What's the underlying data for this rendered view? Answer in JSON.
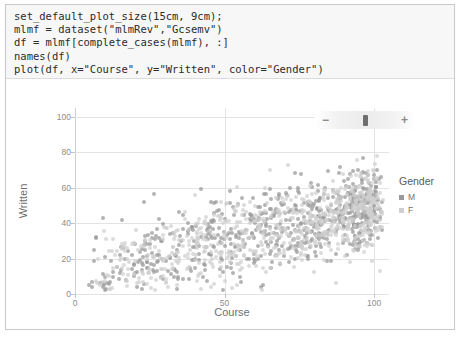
{
  "code_cell": {
    "lines": [
      "set_default_plot_size(15cm, 9cm);",
      "mlmf = dataset(\"mlmRev\",\"Gcsemv\")",
      "df = mlmf[complete_cases(mlmf), :]",
      "names(df)",
      "plot(df, x=\"Course\", y=\"Written\", color=\"Gender\")"
    ]
  },
  "toolbar": {
    "zoom_out_label": "−",
    "zoom_in_label": "+",
    "slider_handle_name": "zoom-slider-handle"
  },
  "legend": {
    "title": "Gender",
    "entries": [
      {
        "label": "M",
        "color": "#9a9a9a"
      },
      {
        "label": "F",
        "color": "#cfcfcf"
      }
    ]
  },
  "chart_data": {
    "type": "scatter",
    "title": "",
    "xlabel": "Course",
    "ylabel": "Written",
    "xlim": [
      0,
      105
    ],
    "ylim": [
      0,
      105
    ],
    "xticks": [
      0,
      50,
      100
    ],
    "yticks": [
      0,
      20,
      40,
      60,
      80,
      100
    ],
    "grid": true,
    "legend_position": "right",
    "color_by": "Gender",
    "series": [
      {
        "name": "M",
        "color": "#9a9a9a",
        "n": 680
      },
      {
        "name": "F",
        "color": "#cfcfcf",
        "n": 720
      }
    ],
    "marker": {
      "shape": "circle",
      "size": 4,
      "opacity": 0.75
    },
    "distribution_note": "Positive association between Course and Written; dense cloud centered near Course 70-95, Written 35-60."
  }
}
